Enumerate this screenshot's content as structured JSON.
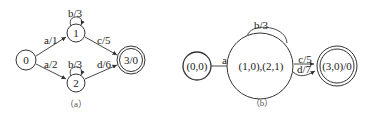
{
  "panel_a": {
    "caption": "（a）",
    "nodes": {
      "n0": "0",
      "n1": "1",
      "n2": "2",
      "n3": "3/0"
    },
    "edges": {
      "e01": "a/1",
      "e02": "a/2",
      "e11": "b/3",
      "e22": "b/3",
      "e13": "c/5",
      "e23": "d/6"
    }
  },
  "panel_b": {
    "caption": "（b）",
    "nodes": {
      "n00": "(0,0)",
      "n1021": "(1,0),(2,1)",
      "n30": "(3,0)/0"
    },
    "edges": {
      "e_a": "a/1",
      "e_loop": "b/3",
      "e_c": "c/5",
      "e_d": "d/7"
    }
  }
}
